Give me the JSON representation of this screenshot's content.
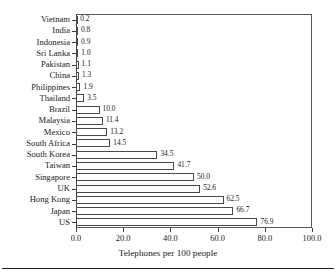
{
  "chart_data": {
    "type": "bar",
    "orientation": "horizontal",
    "title": "",
    "xlabel": "Telephones per 100 people",
    "ylabel": "",
    "xlim": [
      0.0,
      100.0
    ],
    "grid": false,
    "legend": false,
    "xticks": [
      "0.0",
      "20.0",
      "40.0",
      "60.0",
      "80.0",
      "100.0"
    ],
    "xtick_values": [
      0.0,
      20.0,
      40.0,
      60.0,
      80.0,
      100.0
    ],
    "categories": [
      "Vietnam",
      "India",
      "Indonesia",
      "Sri Lanka",
      "Pakistan",
      "China",
      "Philippines",
      "Thailand",
      "Brazil",
      "Malaysia",
      "Mexico",
      "South Africa",
      "South Korea",
      "Taiwan",
      "Singapore",
      "UK",
      "Hong Kong",
      "Japan",
      "US"
    ],
    "values": [
      0.2,
      0.8,
      0.9,
      1.0,
      1.1,
      1.3,
      1.9,
      3.5,
      10.0,
      11.4,
      13.2,
      14.5,
      34.5,
      41.7,
      50.0,
      52.6,
      62.5,
      66.7,
      76.9
    ],
    "value_labels": [
      "0.2",
      "0.8",
      "0.9",
      "1.0",
      "1.1",
      "1.3",
      "1.9",
      "3.5",
      "10.0",
      "11.4",
      "13.2",
      "14.5",
      "34.5",
      "41.7",
      "50.0",
      "52.6",
      "62.5",
      "66.7",
      "76.9"
    ],
    "bar_fill_color": "#ffffff",
    "bar_edge_color": "#4a4a4a",
    "axis_color": "#3d3d3d",
    "background_color": "#ffffff"
  }
}
